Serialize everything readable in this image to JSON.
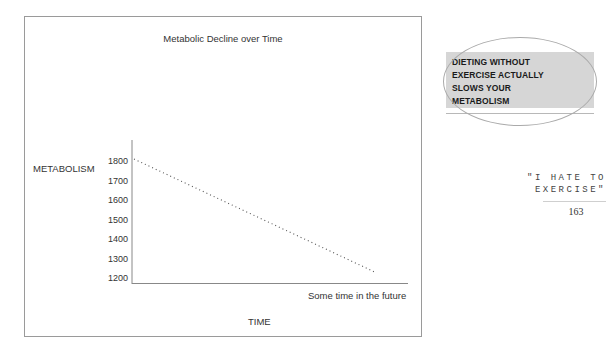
{
  "chart_data": {
    "type": "line",
    "title": "Metabolic Decline over Time",
    "xlabel": "TIME",
    "ylabel": "METABOLISM",
    "yticks": [
      1800,
      1700,
      1600,
      1500,
      1400,
      1300,
      1200
    ],
    "ylim": [
      1200,
      1800
    ],
    "x_annotation": "Some time in the future",
    "grid": false,
    "legend": null,
    "series": [
      {
        "name": "Metabolism",
        "style": "dotted",
        "x": [
          0,
          1
        ],
        "values": [
          1810,
          1230
        ]
      }
    ]
  },
  "chart": {
    "title": "Metabolic Decline over Time",
    "ylabel": "METABOLISM",
    "xlabel": "TIME",
    "x_annotation": "Some time in the future",
    "ticks": [
      "1800",
      "1700",
      "1600",
      "1500",
      "1400",
      "1300",
      "1200"
    ]
  },
  "callout": {
    "lines": [
      "DIETING WITHOUT",
      "EXERCISE ACTUALLY",
      "SLOWS YOUR",
      "METABOLISM"
    ]
  },
  "page": {
    "running_head_line1": "\"I HATE TO",
    "running_head_line2": "EXERCISE\"",
    "number": "163"
  }
}
